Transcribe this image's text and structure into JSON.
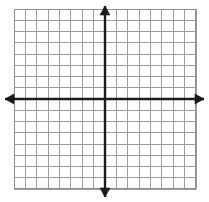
{
  "figure": {
    "kind": "coordinate-grid",
    "title": "",
    "width": 209,
    "height": 202,
    "background_color": "#ffffff"
  },
  "grid": {
    "left": 14,
    "top": 9,
    "right": 196,
    "bottom": 189,
    "columns": 16,
    "rows": 16,
    "cell_width": 11.375,
    "cell_height": 11.25,
    "line_color": "#9a9a9a",
    "border_color": "#8f8f8f",
    "line_width": 1,
    "visible": true
  },
  "axes": {
    "color": "#1a1a1a",
    "line_width": 2.4,
    "arrowheads": true,
    "origin": {
      "x": 105.0,
      "y": 99.0
    },
    "x_axis": {
      "label": "",
      "y": 99.0,
      "start_x": 5,
      "end_x": 204,
      "left_arrow": true,
      "right_arrow": true,
      "tick_labels": [],
      "range": [
        -8,
        8
      ]
    },
    "y_axis": {
      "label": "",
      "x": 105.0,
      "start_y": 6,
      "end_y": 197,
      "up_arrow": true,
      "down_arrow": true,
      "tick_labels": [],
      "range": [
        -8,
        8
      ]
    }
  },
  "chart_data": {
    "type": "scatter",
    "title": "",
    "xlabel": "",
    "ylabel": "",
    "xlim": [
      -8,
      8
    ],
    "ylim": [
      -8,
      8
    ],
    "xticks": [
      -8,
      -7,
      -6,
      -5,
      -4,
      -3,
      -2,
      -1,
      0,
      1,
      2,
      3,
      4,
      5,
      6,
      7,
      8
    ],
    "yticks": [
      -8,
      -7,
      -6,
      -5,
      -4,
      -3,
      -2,
      -1,
      0,
      1,
      2,
      3,
      4,
      5,
      6,
      7,
      8
    ],
    "xtick_labels": [],
    "ytick_labels": [],
    "grid": true,
    "legend": null,
    "series": [],
    "annotations": [],
    "note": "Empty coordinate plane: 16 by 16 unlabeled grid with arrowed x and y axes intersecting at the center; no plotted data."
  }
}
